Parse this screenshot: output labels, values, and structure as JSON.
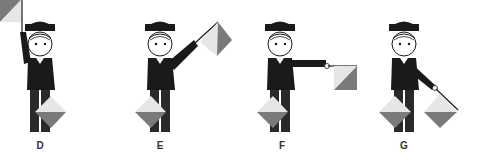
{
  "colors": {
    "dark": "#1a1a1a",
    "flag_light": "#e6e6e6",
    "flag_dark": "#7a7a7a",
    "skin": "#ffffff",
    "background": "#ffffff"
  },
  "figures": [
    {
      "letter": "D",
      "description": "Right arm raised straight up holding flag, left flag low in front"
    },
    {
      "letter": "E",
      "description": "Right arm raised diagonally up-right holding flag, left flag low in front"
    },
    {
      "letter": "F",
      "description": "Right arm extended horizontally holding flag, left flag low in front"
    },
    {
      "letter": "G",
      "description": "Right arm angled down-right holding flag, left flag low in front"
    }
  ]
}
